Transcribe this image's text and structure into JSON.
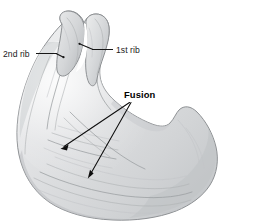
{
  "figure": {
    "background_color": "#ffffff",
    "bone_fill_light": "#e7e8e9",
    "bone_fill_mid": "#cfd1d3",
    "bone_fill_shadow": "#b4b7ba",
    "bone_outline_color": "#8e9194",
    "label_color": "#1a1a1a",
    "leader_color": "#161616"
  },
  "labels": {
    "second_rib": "2nd rib",
    "first_rib": "1st rib",
    "fusion": "Fusion"
  },
  "annotations": {
    "second_rib_leader": "leader line from 2nd rib label right to upper rib shaft",
    "first_rib_leader": "leader line from 1st rib label left to first rib head",
    "fusion_arrow_upper": "arrow from Fusion label down-left to upper fusion site",
    "fusion_arrow_lower": "arrow from Fusion label down-left to lower fusion site"
  }
}
